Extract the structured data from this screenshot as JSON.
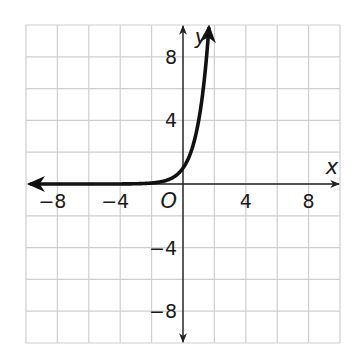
{
  "chart_data": {
    "type": "line",
    "title": "",
    "xlabel": "x",
    "ylabel": "y",
    "origin_label": "O",
    "xlim": [
      -10,
      10
    ],
    "ylim": [
      -10,
      10
    ],
    "grid": true,
    "grid_step": 2,
    "x_ticks": [
      -8,
      -4,
      4,
      8
    ],
    "y_ticks": [
      8,
      4,
      -4,
      -8
    ],
    "x_tick_labels": [
      "−8",
      "−4",
      "4",
      "8"
    ],
    "y_tick_labels": [
      "8",
      "4",
      "−4",
      "−8"
    ],
    "series": [
      {
        "name": "exponential curve",
        "function": "y = 4^x",
        "x": [
          -9.5,
          -4,
          -2,
          -1,
          -0.5,
          0,
          0.5,
          1,
          1.25,
          1.5,
          1.66
        ],
        "y": [
          0.0,
          0.004,
          0.0625,
          0.25,
          0.5,
          1,
          2,
          4,
          5.66,
          8,
          10
        ],
        "arrow_left": true,
        "arrow_right": true,
        "color": "#111111"
      }
    ],
    "legend": null
  },
  "colors": {
    "grid": "#cfcfcf",
    "axis": "#222222",
    "curve": "#111111",
    "text": "#1a1a1a"
  }
}
